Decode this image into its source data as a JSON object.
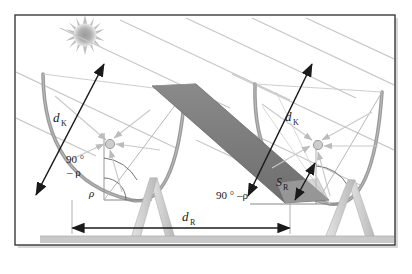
{
  "figure": {
    "background_color": "#ffffff",
    "border_color": "#3a3a3a",
    "ground_color": "#c9c9c9",
    "mirror_color": "#7d7d7d",
    "ray_color": "#c4c4c4",
    "arrow_color": "#1a1a1a",
    "support_color": "#d2d2d2",
    "sun_color": "#a8a8a8"
  },
  "labels": {
    "aperture_left": {
      "symbol": "d",
      "subscript": "K"
    },
    "aperture_right": {
      "symbol": "d",
      "subscript": "K"
    },
    "row_distance": {
      "symbol": "d",
      "subscript": "R"
    },
    "shadow": {
      "symbol": "S",
      "subscript": "R"
    },
    "angle_rho_left": "ρ",
    "angle_complement_left_line1": "90 °",
    "angle_complement_left_line2": "– ρ",
    "angle_complement_right": "90 ° –ρ"
  },
  "elements": {
    "sun": "sun-starburst",
    "left_collector": "parabolic-dish-left",
    "right_collector": "parabolic-dish-right",
    "trough_band": "tilted-mirror-band",
    "left_support": "a-frame-support-left",
    "right_support": "a-frame-support-right",
    "ground": "ground-strip",
    "receiver_left": "focal-receiver-left",
    "receiver_right": "focal-receiver-right"
  }
}
